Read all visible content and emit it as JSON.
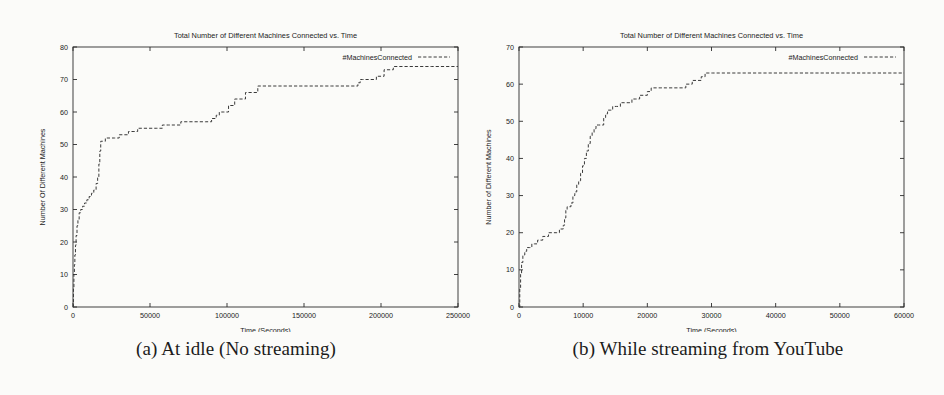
{
  "figure": {
    "subfigures": [
      {
        "caption": "(a) At idle (No streaming)",
        "chart_index": 0
      },
      {
        "caption": "(b) While streaming from YouTube",
        "chart_index": 1
      }
    ]
  },
  "chart_data": [
    {
      "type": "line",
      "title": "Total Number of Different Machines Connected vs. Time",
      "xlabel": "Time (Seconds)",
      "ylabel": "Number Of Different Machines",
      "legend": [
        "#MachinesConnected"
      ],
      "legend_position": "top-right-inside",
      "grid": false,
      "xlim": [
        0,
        250000
      ],
      "ylim": [
        0,
        80
      ],
      "xticks": [
        0,
        50000,
        100000,
        150000,
        200000,
        250000
      ],
      "xtick_labels": [
        "0",
        "50000",
        "100000",
        "150000",
        "200000",
        "250000"
      ],
      "yticks": [
        0,
        10,
        20,
        30,
        40,
        50,
        60,
        70,
        80
      ],
      "ytick_labels": [
        "0",
        "10",
        "20",
        "30",
        "40",
        "50",
        "60",
        "70",
        "80"
      ],
      "series": [
        {
          "name": "#MachinesConnected",
          "style": "step-dashed",
          "x": [
            0,
            300,
            600,
            900,
            1200,
            1600,
            2000,
            2600,
            3200,
            4000,
            5000,
            6200,
            7500,
            9000,
            10500,
            12000,
            13500,
            15000,
            16000,
            16800,
            17400,
            18000,
            19000,
            21000,
            24000,
            27000,
            30000,
            33000,
            36000,
            39000,
            42000,
            46000,
            50000,
            54000,
            58000,
            62000,
            66000,
            70000,
            74000,
            78000,
            82000,
            86000,
            90000,
            93000,
            95000,
            96500,
            97500,
            98500,
            99500,
            101000,
            105000,
            112000,
            120000,
            130000,
            140000,
            148000,
            152000,
            156000,
            162000,
            168000,
            174000,
            180000,
            183000,
            185000,
            186500,
            188000,
            190000,
            193000,
            197000,
            202000,
            208000,
            215000,
            222000,
            228000,
            233000
          ],
          "y": [
            0,
            6,
            10,
            13,
            16,
            19,
            22,
            25,
            27,
            29,
            30,
            31,
            32,
            33,
            34,
            35,
            36,
            38,
            40,
            44,
            48,
            51,
            51,
            52,
            52,
            52,
            53,
            53,
            54,
            54,
            55,
            55,
            55,
            55,
            56,
            56,
            56,
            57,
            57,
            57,
            57,
            57,
            58,
            59,
            60,
            60,
            60,
            60,
            60,
            62,
            64,
            66,
            68,
            68,
            68,
            68,
            68,
            68,
            68,
            68,
            68,
            68,
            68,
            69,
            70,
            70,
            70,
            70,
            71,
            73,
            74,
            74,
            74,
            74,
            74
          ]
        }
      ]
    },
    {
      "type": "line",
      "title": "Total Number of Different Machines Connected vs. Time",
      "xlabel": "Time (Seconds)",
      "ylabel": "Number of Different Machines",
      "legend": [
        "#MachinesConnected"
      ],
      "legend_position": "top-right-inside",
      "grid": false,
      "xlim": [
        0,
        60000
      ],
      "ylim": [
        0,
        70
      ],
      "xticks": [
        0,
        10000,
        20000,
        30000,
        40000,
        50000,
        60000
      ],
      "xtick_labels": [
        "0",
        "10000",
        "20000",
        "30000",
        "40000",
        "50000",
        "60000"
      ],
      "yticks": [
        0,
        10,
        20,
        30,
        40,
        50,
        60,
        70
      ],
      "ytick_labels": [
        "0",
        "10",
        "20",
        "30",
        "40",
        "50",
        "60",
        "70"
      ],
      "series": [
        {
          "name": "#MachinesConnected",
          "style": "step-dashed",
          "x": [
            0,
            120,
            250,
            400,
            600,
            900,
            1200,
            1600,
            2000,
            2400,
            2900,
            3300,
            3700,
            4100,
            4600,
            5000,
            5400,
            5900,
            6300,
            6700,
            6900,
            7100,
            7300,
            7500,
            7800,
            8100,
            8400,
            8700,
            9000,
            9300,
            9600,
            9900,
            10200,
            10500,
            10800,
            11100,
            11400,
            11700,
            12000,
            12400,
            12800,
            13200,
            13500,
            13800,
            14200,
            14600,
            15200,
            15800,
            16400,
            17000,
            17600,
            18200,
            18800,
            19400,
            20000,
            20600,
            21200,
            22000,
            23000,
            24000,
            25000,
            26000,
            27000,
            27800,
            28400,
            29000,
            29600,
            30200,
            30800,
            31200,
            32000,
            34000,
            38000,
            43000,
            48000,
            52000
          ],
          "y": [
            0,
            5,
            9,
            12,
            14,
            15,
            16,
            16,
            17,
            17,
            18,
            18,
            19,
            19,
            20,
            20,
            20,
            20,
            21,
            21,
            22,
            24,
            26,
            27,
            27,
            28,
            30,
            31,
            33,
            34,
            36,
            38,
            40,
            42,
            44,
            46,
            47,
            48,
            49,
            49,
            49,
            51,
            52,
            53,
            53,
            54,
            54,
            55,
            55,
            55,
            56,
            56,
            57,
            57,
            58,
            59,
            59,
            59,
            59,
            59,
            59,
            60,
            61,
            61,
            62,
            63,
            63,
            63,
            63,
            63,
            63,
            63,
            63,
            63,
            63,
            63
          ]
        }
      ]
    }
  ]
}
